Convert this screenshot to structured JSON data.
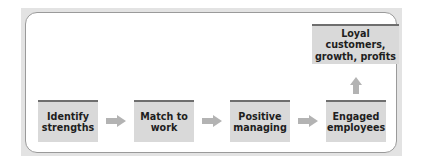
{
  "diagram": {
    "type": "flowchart",
    "steps": [
      {
        "label": "Identify\nstrengths"
      },
      {
        "label": "Match to\nwork"
      },
      {
        "label": "Positive\nmanaging"
      },
      {
        "label": "Engaged\nemployees"
      }
    ],
    "outcome": {
      "label": "Loyal customers,\ngrowth, profits"
    },
    "connectors": [
      {
        "from": "Identify strengths",
        "to": "Match to work",
        "direction": "right"
      },
      {
        "from": "Match to work",
        "to": "Positive managing",
        "direction": "right"
      },
      {
        "from": "Positive managing",
        "to": "Engaged employees",
        "direction": "right"
      },
      {
        "from": "Engaged employees",
        "to": "Loyal customers, growth, profits",
        "direction": "up"
      }
    ],
    "colors": {
      "box_fill": "#d9d9d9",
      "box_top_border": "#6e6e6e",
      "arrow": "#b3b3b3",
      "frame": "#e3e3e3",
      "inner_border": "#9a9a9a"
    }
  }
}
